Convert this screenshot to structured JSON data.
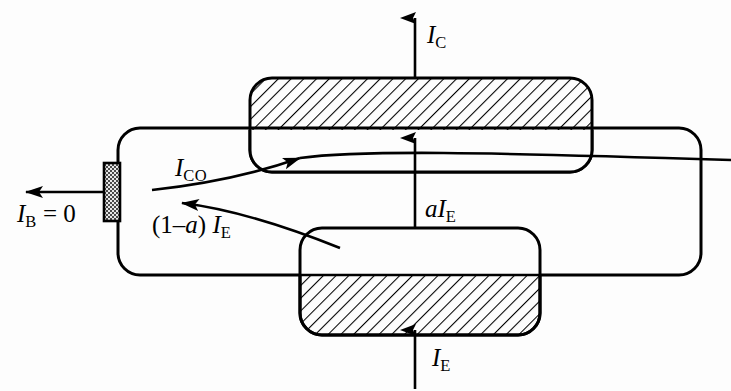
{
  "figure": {
    "type": "transistor-cross-section",
    "title": "",
    "background_color": "#fdfdfd",
    "line_color": "#000000",
    "hatch_color": "#000000"
  },
  "regions": [
    {
      "name": "base-body",
      "label": "",
      "fill": "none",
      "x": 118,
      "y": 128,
      "width": 583,
      "height": 147,
      "radius": 22
    },
    {
      "name": "collector-region",
      "label": "",
      "hatched": true,
      "x": 250,
      "y": 78,
      "width": 342,
      "height": 94,
      "radius": 22
    },
    {
      "name": "emitter-region",
      "label": "",
      "hatched": true,
      "x": 300,
      "y": 228,
      "width": 240,
      "height": 107,
      "radius": 22
    },
    {
      "name": "base-contact",
      "label": "",
      "stippled": true,
      "x": 104,
      "y": 163,
      "width": 16,
      "height": 58
    }
  ],
  "currents": [
    {
      "id": "ic",
      "symbol": "I",
      "subscript": "C",
      "text": "I_C",
      "direction": "up",
      "terminal": "collector",
      "description": "collector current out of collector region"
    },
    {
      "id": "ico",
      "symbol": "I",
      "subscript": "CO",
      "text": "I_CO",
      "direction": "right",
      "terminal": "base-to-collector",
      "description": "collector leakage current into collector region"
    },
    {
      "id": "ib",
      "symbol": "I",
      "subscript": "B",
      "text": "I_B = 0",
      "equals_value": "0",
      "direction": "left",
      "terminal": "base",
      "description": "base current is zero"
    },
    {
      "id": "a_ie",
      "symbol": "a",
      "text": "aI_E",
      "direction": "up",
      "terminal": "emitter-to-collector",
      "description": "alpha times emitter current transported across base"
    },
    {
      "id": "one_minus_a_ie",
      "symbol": "(1 - a)",
      "text": "(1 - a) I_E",
      "direction": "left",
      "terminal": "emitter-to-base",
      "description": "recombination component of emitter current"
    },
    {
      "id": "ie",
      "symbol": "I",
      "subscript": "E",
      "text": "I_E",
      "direction": "up",
      "terminal": "emitter",
      "description": "emitter current into emitter region"
    }
  ],
  "labels": {
    "ic": {
      "main": "I",
      "sub": "C"
    },
    "ico": {
      "main": "I",
      "sub": "CO"
    },
    "ib": {
      "main": "I",
      "sub": "B",
      "tail": " = 0"
    },
    "aie": {
      "alpha": "a",
      "main": "I",
      "sub": "E"
    },
    "one_minus_aie": {
      "prefix": "(1",
      "minus": "–",
      "alpha": "a",
      "close": ")",
      "main": "I",
      "sub": "E"
    },
    "ie": {
      "main": "I",
      "sub": "E"
    }
  }
}
